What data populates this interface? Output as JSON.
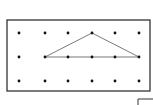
{
  "diagram": {
    "type": "dot-grid-geoboard",
    "frame": {
      "x": 7,
      "y": 20,
      "width": 143,
      "height": 71,
      "stroke": "#333333"
    },
    "grid": {
      "columns_x": [
        19,
        45,
        68,
        92,
        115,
        139
      ],
      "rows_y": [
        33,
        57,
        81
      ],
      "dot_color": "#111111",
      "dot_radius": 1.4
    },
    "triangle": {
      "points": [
        [
          45,
          57
        ],
        [
          92,
          33
        ],
        [
          139,
          57
        ]
      ],
      "stroke": "#555555"
    },
    "base_line_points": [
      [
        45,
        57
      ],
      [
        68,
        57
      ],
      [
        92,
        57
      ],
      [
        115,
        57
      ],
      [
        139,
        57
      ]
    ],
    "corner_mark": {
      "x": 138,
      "y": 99
    }
  }
}
